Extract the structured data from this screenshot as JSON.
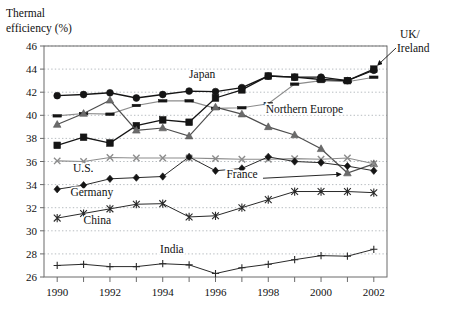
{
  "chart_data": {
    "type": "line",
    "title": "",
    "ylabel": "Thermal\nefficiency (%)",
    "ylabel_line1": "Thermal",
    "ylabel_line2": "efficiency (%)",
    "xlabel": "",
    "x": [
      1990,
      1991,
      1992,
      1993,
      1994,
      1995,
      1996,
      1997,
      1998,
      1999,
      2000,
      2001,
      2002
    ],
    "xtick_labels": [
      "1990",
      "",
      "1992",
      "",
      "1994",
      "",
      "1996",
      "",
      "1998",
      "",
      "2000",
      "",
      "2002"
    ],
    "xlim": [
      1989.5,
      2002.5
    ],
    "ylim": [
      26,
      46
    ],
    "yticks": [
      26,
      28,
      30,
      32,
      34,
      36,
      38,
      40,
      42,
      44,
      46
    ],
    "ytick_labels": [
      "26",
      "28",
      "30",
      "32",
      "34",
      "36",
      "38",
      "40",
      "42",
      "44",
      "46"
    ],
    "grid": "horizontal-dashed",
    "legend": "inline-annotations",
    "series": [
      {
        "name": "Japan",
        "marker": "filled-circle",
        "color": "#151515",
        "label_x": 1995.0,
        "label_y": 43.2,
        "values": [
          41.7,
          41.8,
          41.95,
          41.5,
          41.8,
          42.1,
          42.05,
          42.4,
          43.4,
          43.3,
          43.3,
          43.0,
          43.9
        ]
      },
      {
        "name": "Northern Europe",
        "marker": "dash",
        "color": "#8c8c8c",
        "label_x": 1997.9,
        "label_y": 40.2,
        "values": [
          39.95,
          40.15,
          40.1,
          40.85,
          41.25,
          41.25,
          40.6,
          40.65,
          41.0,
          42.7,
          43.0,
          42.9,
          43.3
        ]
      },
      {
        "name": "UK/Ireland",
        "marker": "filled-square",
        "color": "#151515",
        "label_x": 2003.2,
        "label_y": 45.6,
        "label_line1": "UK/",
        "label_line2": "Ireland",
        "values": [
          37.4,
          38.1,
          37.6,
          39.1,
          39.6,
          39.4,
          41.5,
          42.2,
          43.4,
          43.3,
          43.1,
          43.0,
          44.0
        ]
      },
      {
        "name": "France",
        "marker": "filled-triangle",
        "color": "#6b6b6b",
        "label_x": 1997.6,
        "label_y": 34.6,
        "values": [
          39.2,
          40.15,
          41.3,
          38.7,
          38.9,
          38.2,
          40.7,
          40.1,
          39.0,
          38.3,
          37.1,
          35.0,
          35.8
        ]
      },
      {
        "name": "U.S.",
        "marker": "cross-x",
        "color": "#8c8c8c",
        "label_x": 1990.6,
        "label_y": 35.1,
        "values": [
          36.05,
          36.0,
          36.35,
          36.3,
          36.3,
          36.3,
          36.25,
          36.2,
          36.2,
          36.25,
          36.2,
          36.3,
          35.8
        ]
      },
      {
        "name": "Germany",
        "marker": "filled-diamond",
        "color": "#2a2a2a",
        "label_x": 1990.5,
        "label_y": 33.0,
        "values": [
          33.6,
          33.95,
          34.5,
          34.6,
          34.7,
          36.4,
          35.2,
          35.4,
          36.4,
          36.0,
          35.9,
          35.6,
          35.2
        ]
      },
      {
        "name": "China",
        "marker": "asterisk",
        "color": "#2a2a2a",
        "label_x": 1991.0,
        "label_y": 30.6,
        "values": [
          31.1,
          31.5,
          31.9,
          32.3,
          32.35,
          31.2,
          31.3,
          32.0,
          32.7,
          33.4,
          33.4,
          33.4,
          33.3
        ]
      },
      {
        "name": "India",
        "marker": "plus",
        "color": "#2a2a2a",
        "label_x": 1993.9,
        "label_y": 28.05,
        "values": [
          27.0,
          27.1,
          26.9,
          26.9,
          27.15,
          27.05,
          26.3,
          26.8,
          27.1,
          27.5,
          27.85,
          27.8,
          28.4
        ]
      }
    ]
  }
}
